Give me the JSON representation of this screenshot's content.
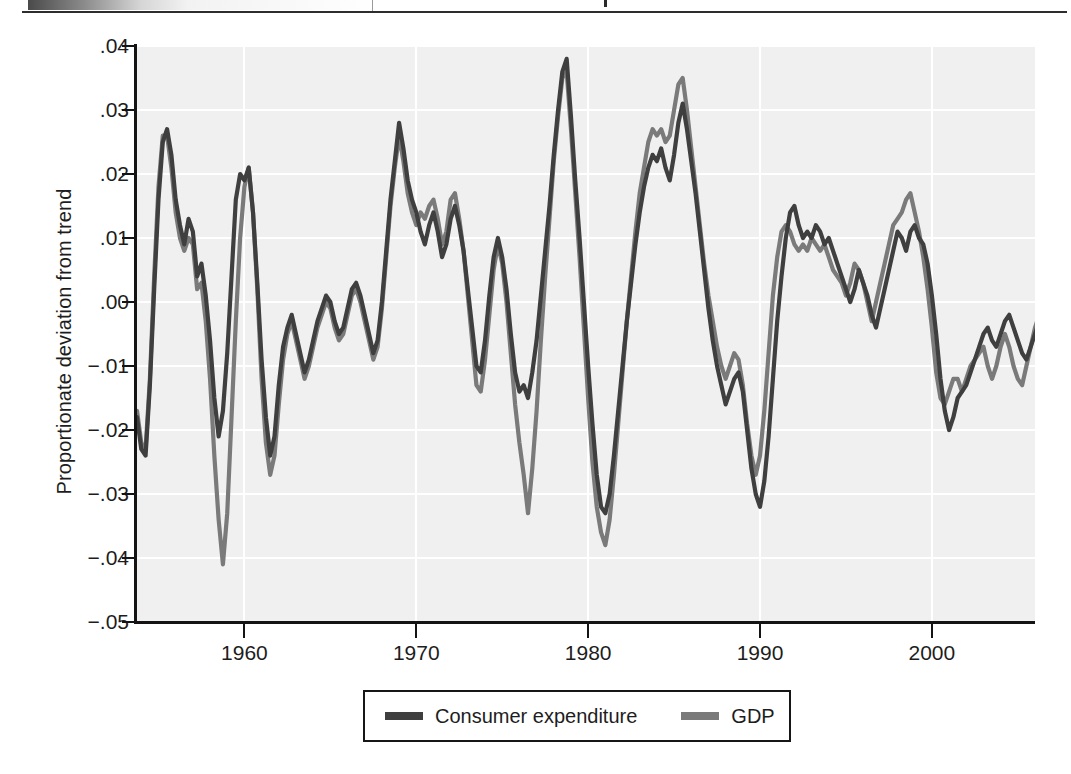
{
  "figure": {
    "kind": "line-chart",
    "background": "#ffffff",
    "plot_background": "#f0f0f0",
    "gridline_color": "#ffffff",
    "axis_color": "#141414"
  },
  "scan_artifact": {
    "present": true,
    "description": "partial dark gradient strip and rule from scanned page edge"
  },
  "chart_data": {
    "type": "line",
    "title": "",
    "subtitle": "",
    "xlabel": "",
    "ylabel": "Proportionate deviation from trend",
    "xlim": [
      1953.75,
      2006.0
    ],
    "ylim": [
      -0.05,
      0.04
    ],
    "grid": true,
    "legend_position": "below-center",
    "xticks": [
      1960,
      1970,
      1980,
      1990,
      2000
    ],
    "xtick_labels": [
      "1960",
      "1970",
      "1980",
      "1990",
      "2000"
    ],
    "yticks": [
      0.04,
      0.03,
      0.02,
      0.01,
      0.0,
      -0.01,
      -0.02,
      -0.03,
      -0.04,
      -0.05
    ],
    "ytick_labels": [
      ".04",
      ".03",
      ".02",
      ".01",
      ".00",
      "−.01",
      "−.02",
      "−.03",
      "−.04",
      "−.05"
    ],
    "colors": {
      "consumer_expenditure": "#3f3f3f",
      "gdp": "#7a7a7a"
    },
    "x_start": 1953.75,
    "x_step": 0.25,
    "series": [
      {
        "name": "Consumer expenditure",
        "color": "#3f3f3f",
        "values": [
          -0.018,
          -0.023,
          -0.024,
          -0.013,
          0.002,
          0.016,
          0.025,
          0.027,
          0.023,
          0.016,
          0.012,
          0.009,
          0.013,
          0.011,
          0.004,
          0.006,
          0.001,
          -0.006,
          -0.015,
          -0.021,
          -0.017,
          -0.008,
          0.004,
          0.016,
          0.02,
          0.019,
          0.021,
          0.014,
          0.003,
          -0.009,
          -0.018,
          -0.024,
          -0.021,
          -0.013,
          -0.007,
          -0.004,
          -0.002,
          -0.005,
          -0.008,
          -0.011,
          -0.009,
          -0.006,
          -0.003,
          -0.001,
          0.001,
          0.0,
          -0.003,
          -0.005,
          -0.004,
          -0.001,
          0.002,
          0.003,
          0.001,
          -0.002,
          -0.005,
          -0.008,
          -0.006,
          0.0,
          0.008,
          0.016,
          0.022,
          0.028,
          0.024,
          0.019,
          0.016,
          0.014,
          0.011,
          0.009,
          0.012,
          0.014,
          0.011,
          0.007,
          0.009,
          0.013,
          0.015,
          0.012,
          0.008,
          0.002,
          -0.004,
          -0.01,
          -0.011,
          -0.006,
          0.001,
          0.007,
          0.01,
          0.007,
          0.002,
          -0.005,
          -0.011,
          -0.014,
          -0.013,
          -0.015,
          -0.011,
          -0.006,
          0.001,
          0.008,
          0.015,
          0.023,
          0.03,
          0.036,
          0.038,
          0.029,
          0.019,
          0.01,
          0.0,
          -0.01,
          -0.019,
          -0.027,
          -0.032,
          -0.033,
          -0.03,
          -0.024,
          -0.017,
          -0.01,
          -0.003,
          0.003,
          0.009,
          0.014,
          0.018,
          0.021,
          0.023,
          0.022,
          0.024,
          0.021,
          0.019,
          0.023,
          0.028,
          0.031,
          0.027,
          0.022,
          0.017,
          0.011,
          0.005,
          -0.001,
          -0.006,
          -0.01,
          -0.013,
          -0.016,
          -0.014,
          -0.012,
          -0.011,
          -0.014,
          -0.02,
          -0.026,
          -0.03,
          -0.032,
          -0.028,
          -0.021,
          -0.012,
          -0.003,
          0.004,
          0.01,
          0.014,
          0.015,
          0.012,
          0.01,
          0.011,
          0.01,
          0.012,
          0.011,
          0.009,
          0.01,
          0.008,
          0.006,
          0.004,
          0.002,
          0.0,
          0.002,
          0.005,
          0.003,
          0.001,
          -0.002,
          -0.004,
          -0.001,
          0.002,
          0.005,
          0.008,
          0.011,
          0.01,
          0.008,
          0.011,
          0.012,
          0.01,
          0.009,
          0.006,
          0.001,
          -0.005,
          -0.012,
          -0.017,
          -0.02,
          -0.018,
          -0.015,
          -0.014,
          -0.013,
          -0.011,
          -0.009,
          -0.007,
          -0.005,
          -0.004,
          -0.006,
          -0.007,
          -0.005,
          -0.003,
          -0.002,
          -0.004,
          -0.006,
          -0.008,
          -0.009,
          -0.007,
          -0.005,
          -0.003,
          -0.001,
          0.001,
          0.003,
          0.002,
          0.0,
          -0.002,
          -0.003,
          -0.005,
          -0.004,
          -0.002,
          0.0,
          0.002,
          0.005,
          0.007,
          0.009,
          0.01,
          0.012,
          0.014,
          0.015,
          0.013,
          0.01,
          0.006,
          0.002,
          -0.002,
          -0.005,
          -0.007,
          -0.009,
          -0.011,
          -0.01,
          -0.007,
          -0.004,
          -0.001,
          0.001,
          0.004,
          0.006,
          0.005,
          0.003,
          0.005,
          0.002,
          0.0,
          0.001,
          0.002,
          -0.001,
          0.001,
          0.002
        ]
      },
      {
        "name": "GDP",
        "color": "#7a7a7a",
        "values": [
          -0.017,
          -0.022,
          -0.023,
          -0.012,
          0.004,
          0.018,
          0.026,
          0.026,
          0.021,
          0.014,
          0.01,
          0.008,
          0.01,
          0.009,
          0.002,
          0.003,
          -0.003,
          -0.012,
          -0.024,
          -0.034,
          -0.041,
          -0.033,
          -0.018,
          -0.003,
          0.01,
          0.018,
          0.021,
          0.014,
          0.002,
          -0.012,
          -0.022,
          -0.027,
          -0.024,
          -0.016,
          -0.009,
          -0.005,
          -0.003,
          -0.006,
          -0.009,
          -0.012,
          -0.01,
          -0.007,
          -0.004,
          -0.002,
          0.0,
          -0.001,
          -0.004,
          -0.006,
          -0.005,
          -0.002,
          0.001,
          0.002,
          0.0,
          -0.003,
          -0.006,
          -0.009,
          -0.007,
          -0.001,
          0.007,
          0.015,
          0.021,
          0.026,
          0.022,
          0.017,
          0.014,
          0.012,
          0.014,
          0.013,
          0.015,
          0.016,
          0.013,
          0.009,
          0.011,
          0.016,
          0.017,
          0.013,
          0.008,
          0.001,
          -0.006,
          -0.013,
          -0.014,
          -0.009,
          -0.002,
          0.005,
          0.009,
          0.006,
          0.0,
          -0.008,
          -0.016,
          -0.022,
          -0.027,
          -0.033,
          -0.026,
          -0.017,
          -0.006,
          0.004,
          0.013,
          0.022,
          0.029,
          0.035,
          0.036,
          0.027,
          0.017,
          0.007,
          -0.004,
          -0.015,
          -0.025,
          -0.032,
          -0.036,
          -0.038,
          -0.034,
          -0.027,
          -0.019,
          -0.011,
          -0.003,
          0.004,
          0.011,
          0.017,
          0.021,
          0.025,
          0.027,
          0.026,
          0.027,
          0.025,
          0.026,
          0.03,
          0.034,
          0.035,
          0.03,
          0.024,
          0.018,
          0.012,
          0.006,
          0.001,
          -0.003,
          -0.007,
          -0.01,
          -0.012,
          -0.01,
          -0.008,
          -0.009,
          -0.013,
          -0.019,
          -0.024,
          -0.027,
          -0.024,
          -0.017,
          -0.008,
          0.001,
          0.007,
          0.011,
          0.012,
          0.011,
          0.009,
          0.008,
          0.009,
          0.008,
          0.01,
          0.009,
          0.008,
          0.009,
          0.007,
          0.005,
          0.004,
          0.003,
          0.001,
          0.003,
          0.006,
          0.005,
          0.003,
          0.0,
          -0.003,
          0.0,
          0.003,
          0.006,
          0.009,
          0.012,
          0.013,
          0.014,
          0.016,
          0.017,
          0.014,
          0.011,
          0.007,
          0.002,
          -0.004,
          -0.011,
          -0.015,
          -0.016,
          -0.014,
          -0.012,
          -0.012,
          -0.014,
          -0.012,
          -0.01,
          -0.009,
          -0.008,
          -0.007,
          -0.01,
          -0.012,
          -0.01,
          -0.007,
          -0.005,
          -0.007,
          -0.01,
          -0.012,
          -0.013,
          -0.01,
          -0.007,
          -0.004,
          -0.002,
          0.0,
          0.003,
          0.004,
          0.002,
          0.0,
          -0.002,
          -0.004,
          -0.003,
          0.0,
          0.003,
          0.006,
          0.01,
          0.014,
          0.017,
          0.019,
          0.021,
          0.023,
          0.024,
          0.021,
          0.016,
          0.01,
          0.004,
          -0.002,
          -0.007,
          -0.011,
          -0.015,
          -0.019,
          -0.02,
          -0.016,
          -0.012,
          -0.008,
          -0.005,
          -0.002,
          0.0,
          0.001,
          0.0,
          0.002,
          0.003,
          0.004,
          0.005,
          0.006,
          0.005,
          0.006,
          0.007
        ]
      }
    ]
  },
  "legend": {
    "entries": [
      {
        "label": "Consumer expenditure",
        "color": "#3f3f3f"
      },
      {
        "label": "GDP",
        "color": "#7a7a7a"
      }
    ]
  }
}
